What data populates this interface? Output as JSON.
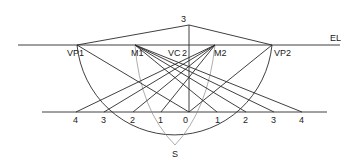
{
  "diagram": {
    "eye_level": {
      "label": "EL",
      "y": 45,
      "x1": 18,
      "x2": 340
    },
    "ground_line": {
      "y": 112,
      "x1": 42,
      "x2": 327
    },
    "top_point": {
      "label": "3",
      "x": 189,
      "y": 25
    },
    "station_point": {
      "label": "S",
      "x": 175,
      "y": 145
    },
    "horizon_points": [
      {
        "id": "VP1",
        "label": "VP1",
        "x": 77,
        "y": 45
      },
      {
        "id": "M1",
        "label": "M1",
        "x": 135,
        "y": 45
      },
      {
        "id": "VC",
        "label": "VC",
        "x": 181,
        "y": 45
      },
      {
        "id": "M2",
        "label": "M2",
        "x": 215,
        "y": 45
      },
      {
        "id": "VP2",
        "label": "VP2",
        "x": 272,
        "y": 45
      }
    ],
    "vertical_label": {
      "label": "2",
      "x": 189
    },
    "ground_ticks": [
      {
        "label": "4",
        "x": 76
      },
      {
        "label": "3",
        "x": 104
      },
      {
        "label": "2",
        "x": 133
      },
      {
        "label": "1",
        "x": 161
      },
      {
        "label": "0",
        "x": 189
      },
      {
        "label": "1",
        "x": 217
      },
      {
        "label": "2",
        "x": 246
      },
      {
        "label": "3",
        "x": 274
      },
      {
        "label": "4",
        "x": 302
      }
    ]
  },
  "labels": {
    "el": "EL",
    "top": "3",
    "vp1": "VP1",
    "m1": "M1",
    "vc": "VC",
    "vc_num": "2",
    "m2": "M2",
    "vp2": "VP2",
    "s": "S",
    "g0": "4",
    "g1": "3",
    "g2": "2",
    "g3": "1",
    "g4": "0",
    "g5": "1",
    "g6": "2",
    "g7": "3",
    "g8": "4"
  }
}
